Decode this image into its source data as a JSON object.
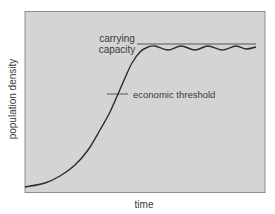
{
  "chart_data": {
    "type": "line",
    "title": "",
    "xlabel": "time",
    "ylabel": "population density",
    "grid": false,
    "legend": null,
    "x_ticks": [],
    "y_ticks": [],
    "series": [
      {
        "name": "population growth curve",
        "shape": "logistic (S-shaped) with damped oscillations near carrying capacity",
        "points_px": [
          [
            25,
            187
          ],
          [
            45,
            183
          ],
          [
            60,
            176
          ],
          [
            75,
            165
          ],
          [
            88,
            150
          ],
          [
            100,
            130
          ],
          [
            110,
            112
          ],
          [
            118,
            94
          ],
          [
            125,
            78
          ],
          [
            132,
            63
          ],
          [
            140,
            52
          ],
          [
            148,
            47
          ],
          [
            155,
            46
          ],
          [
            168,
            50
          ],
          [
            181,
            46
          ],
          [
            195,
            50
          ],
          [
            208,
            46
          ],
          [
            222,
            50
          ],
          [
            236,
            46
          ],
          [
            246,
            49
          ],
          [
            256,
            47
          ]
        ]
      }
    ],
    "annotations": [
      {
        "text": "carrying capacity",
        "type": "horizontal-line",
        "line_px": {
          "x1": 137,
          "x2": 256,
          "y": 44
        }
      },
      {
        "text": "economic threshold",
        "type": "tick-mark",
        "line_px": {
          "x1": 107,
          "x2": 128,
          "y": 94
        }
      }
    ]
  },
  "labels": {
    "xlabel": "time",
    "ylabel": "population density",
    "carrying_line1": "carrying",
    "carrying_line2": "capacity",
    "economic_threshold": "economic threshold"
  },
  "colors": {
    "plot_bg": "#d4d4d4",
    "border": "#8c8c8c",
    "curve": "#2b2b2b",
    "lines": "#555555",
    "text": "#3a3a3a",
    "page_bg": "#ffffff"
  }
}
